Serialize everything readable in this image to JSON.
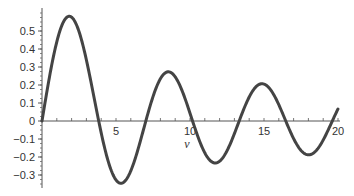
{
  "chart_data": {
    "type": "line",
    "title": "",
    "xlabel": "v",
    "ylabel": "",
    "xlim": [
      0,
      20
    ],
    "ylim": [
      -0.35,
      0.6
    ],
    "grid": false,
    "legend": null,
    "x_ticks": [
      5,
      10,
      15,
      20
    ],
    "x_tick_labels": [
      "5",
      "10",
      "15",
      "20"
    ],
    "y_ticks": [
      0.5,
      0.4,
      0.3,
      0.2,
      0.1,
      0,
      -0.1,
      -0.2,
      -0.3
    ],
    "y_tick_labels": [
      "0.5",
      "0.4",
      "0.3",
      "0.2",
      "0.1",
      "0",
      "−0.1",
      "−0.2",
      "−0.3"
    ],
    "series": [
      {
        "name": "J1(v)",
        "color": "#444444",
        "x": [
          0,
          1,
          1.84,
          3,
          3.83,
          5,
          5.33,
          6,
          7.02,
          8,
          8.54,
          9,
          10.17,
          11,
          11.71,
          12,
          13.32,
          14,
          14.86,
          16,
          16.47,
          17,
          18.02,
          19,
          19.62,
          20
        ],
        "y": [
          0,
          0.44,
          0.58,
          0.34,
          0,
          -0.33,
          -0.35,
          -0.28,
          0,
          0.23,
          0.27,
          0.25,
          0,
          -0.18,
          -0.22,
          -0.22,
          0,
          0.13,
          0.21,
          0.09,
          0,
          -0.1,
          -0.19,
          -0.11,
          0,
          0.07
        ]
      }
    ],
    "annotations": []
  }
}
